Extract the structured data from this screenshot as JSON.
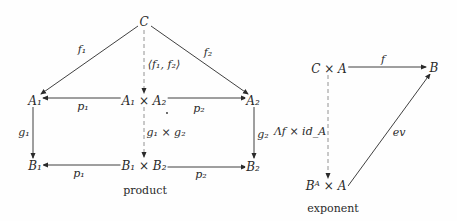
{
  "product": {
    "caption": "product",
    "nodes": {
      "C": "C",
      "A1": "A₁",
      "A1xA2": "A₁ × A₂",
      "A2": "A₂",
      "B1": "B₁",
      "B1xB2": "B₁ × B₂",
      "B2": "B₂"
    },
    "arrows": {
      "f1": "f₁",
      "f2": "f₂",
      "pair": "⟨f₁, f₂⟩",
      "p1_top": "p₁",
      "p2_top": "p₂",
      "g1": "g₁",
      "g2": "g₂",
      "g1xg2": "g₁ × g₂",
      "p1_bottom": "p₁",
      "p2_bottom": "p₂"
    }
  },
  "exponent": {
    "caption": "exponent",
    "nodes": {
      "CxA": "C × A",
      "B": "B",
      "BAxA": "Bᴬ × A"
    },
    "arrows": {
      "f": "f",
      "lambda": "Λf × id_A",
      "ev": "ev"
    }
  },
  "colors": {
    "ink": "#2a2a2a",
    "dashed": "#888888",
    "background": "#fefefe"
  }
}
